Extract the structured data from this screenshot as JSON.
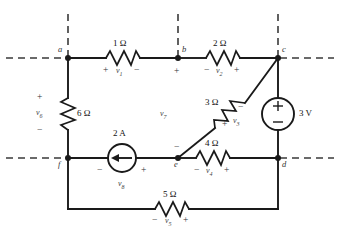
{
  "figure": {
    "type": "circuit-schematic",
    "line_color": "#1a1a1a",
    "dash_color": "#333333"
  },
  "nodes": [
    {
      "id": "a",
      "label": "a",
      "x": 68,
      "y": 58
    },
    {
      "id": "b",
      "label": "b",
      "x": 178,
      "y": 58
    },
    {
      "id": "c",
      "label": "c",
      "x": 278,
      "y": 58
    },
    {
      "id": "d",
      "label": "d",
      "x": 278,
      "y": 158
    },
    {
      "id": "e",
      "label": "e",
      "x": 178,
      "y": 158
    },
    {
      "id": "f",
      "label": "f",
      "x": 68,
      "y": 158
    }
  ],
  "components": [
    {
      "id": "r1",
      "kind": "resistor",
      "value": "1 Ω",
      "voltage": "v",
      "voltage_sub": "1",
      "polarity_left": "+",
      "polarity_right": "−",
      "between": "a-b"
    },
    {
      "id": "r2",
      "kind": "resistor",
      "value": "2 Ω",
      "voltage": "v",
      "voltage_sub": "2",
      "polarity_left": "−",
      "polarity_right": "+",
      "between": "b-c"
    },
    {
      "id": "r3",
      "kind": "resistor",
      "value": "3 Ω",
      "voltage": "v",
      "voltage_sub": "3",
      "polarity_upper": "−",
      "polarity_lower": "+",
      "between": "e-c"
    },
    {
      "id": "r4",
      "kind": "resistor",
      "value": "4 Ω",
      "voltage": "v",
      "voltage_sub": "4",
      "polarity_left": "−",
      "polarity_right": "+",
      "between": "e-d"
    },
    {
      "id": "r5",
      "kind": "resistor",
      "value": "5 Ω",
      "voltage": "v",
      "voltage_sub": "5",
      "polarity_left": "−",
      "polarity_right": "+",
      "between": "f-d"
    },
    {
      "id": "r6",
      "kind": "resistor",
      "value": "6 Ω",
      "voltage": "v",
      "voltage_sub": "6",
      "polarity_top": "+",
      "polarity_bottom": "−",
      "between": "a-f"
    },
    {
      "id": "vs1",
      "kind": "voltage-source",
      "value": "3 V",
      "terminal_top": "+",
      "terminal_bottom": "−",
      "between": "c-d"
    },
    {
      "id": "is1",
      "kind": "current-source",
      "value": "2 A",
      "direction": "left",
      "voltage": "v",
      "voltage_sub": "8",
      "polarity_left": "−",
      "polarity_right": "+",
      "between": "f-e"
    },
    {
      "id": "branch7",
      "kind": "open-branch-voltage",
      "voltage": "v",
      "voltage_sub": "7",
      "polarity_top": "+",
      "polarity_bottom": "−",
      "between": "b-e"
    }
  ]
}
